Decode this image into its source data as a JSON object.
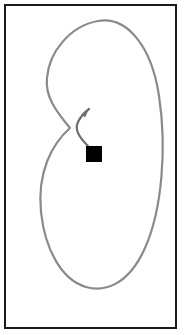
{
  "figure": {
    "type": "trajectory-diagram",
    "width": 184,
    "height": 335,
    "background_color": "#ffffff",
    "caption": "",
    "title": "",
    "border": {
      "name": "plot-frame",
      "color": "#1a1a1a",
      "stroke_width": 2,
      "x": 5,
      "y": 5,
      "width": 171,
      "height": 323,
      "fill": "#ffffff"
    },
    "curve": {
      "name": "looped-trajectory-path",
      "color": "#8a8a8a",
      "stroke_width": 2.2,
      "closed_loop": true,
      "self_intersection_point": [
        70,
        128
      ],
      "extremes": {
        "top": [
          98,
          21
        ],
        "bottom": [
          98,
          288
        ],
        "left_upper_lobe": [
          47,
          78
        ],
        "left_lower_lobe": [
          41,
          212
        ],
        "right": [
          160,
          165
        ]
      },
      "path": "M 70 128 C 55 110 45 96 47 78 C 49 52 70 26 98 21 C 128 16 152 48 159 96 C 167 148 162 210 145 248 C 128 286 104 292 86 287 C 62 280 45 250 41 212 C 37 172 52 144 70 128 Z"
    },
    "marker": {
      "name": "square-marker",
      "shape": "square",
      "color": "#000000",
      "x": 86,
      "y": 146,
      "size": 16
    },
    "arrow": {
      "name": "direction-arrow",
      "color": "#6f6f6f",
      "stroke_width": 2.2,
      "tail": [
        88,
        146
      ],
      "tip": [
        89,
        109
      ],
      "direction": "up-right",
      "head_length": 9,
      "head_width": 5,
      "path": "M 88 146 C 80 138 74 130 78 122 C 81 116 85 112 89 109"
    },
    "colors": {
      "frame": "#1a1a1a",
      "curve": "#8a8a8a",
      "marker": "#000000",
      "arrow": "#6f6f6f",
      "background": "#ffffff"
    }
  }
}
